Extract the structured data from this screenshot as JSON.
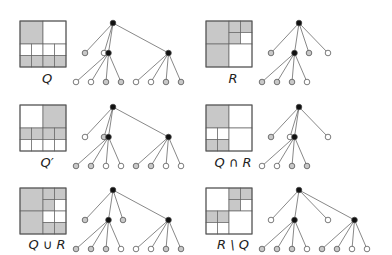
{
  "colors": {
    "gray": "#c8c8c8",
    "white": "#ffffff",
    "black": "#111111",
    "line": "#555555"
  },
  "panels": [
    {
      "id": "Q",
      "label": "Q",
      "x": 20,
      "y": 21,
      "grid": {
        "TL": "gray",
        "TR": "white",
        "BL": [
          "white",
          "white",
          "gray",
          "gray"
        ],
        "BR": [
          "white",
          "white",
          "gray",
          "gray"
        ]
      },
      "tree": {
        "root": [
          "gray",
          "white",
          {
            "children": [
              "white",
              "white",
              "gray",
              "gray"
            ]
          },
          {
            "children": [
              "white",
              "white",
              "gray",
              "gray"
            ]
          }
        ]
      }
    },
    {
      "id": "R",
      "label": "R",
      "x": 206,
      "y": 21,
      "grid": {
        "TL": "gray",
        "TR": [
          "gray",
          "gray",
          "gray",
          "white"
        ],
        "BL": "gray",
        "BR": "white"
      },
      "tree": {
        "root": [
          "gray",
          {
            "children": [
              "gray",
              "gray",
              "gray",
              "white"
            ]
          },
          "gray",
          "white"
        ]
      }
    },
    {
      "id": "Qprime",
      "label": "Q′",
      "x": 20,
      "y": 105,
      "grid": {
        "TL": "white",
        "TR": "gray",
        "BL": [
          "gray",
          "gray",
          "white",
          "white"
        ],
        "BR": [
          "gray",
          "gray",
          "white",
          "white"
        ]
      },
      "tree": {
        "root": [
          "white",
          "gray",
          {
            "children": [
              "gray",
              "gray",
              "white",
              "white"
            ]
          },
          {
            "children": [
              "gray",
              "gray",
              "white",
              "white"
            ]
          }
        ]
      }
    },
    {
      "id": "QcapR",
      "label": "Q ∩ R",
      "x": 206,
      "y": 105,
      "grid": {
        "TL": "gray",
        "TR": "white",
        "BL": [
          "white",
          "white",
          "gray",
          "gray"
        ],
        "BR": "white"
      },
      "tree": {
        "root": [
          "gray",
          "white",
          {
            "children": [
              "white",
              "white",
              "gray",
              "gray"
            ]
          },
          "white"
        ]
      }
    },
    {
      "id": "QcupR",
      "label": "Q ∪ R",
      "x": 20,
      "y": 188,
      "grid": {
        "TL": "gray",
        "TR": [
          "gray",
          "gray",
          "gray",
          "white"
        ],
        "BL": "gray",
        "BR": [
          "white",
          "white",
          "gray",
          "gray"
        ]
      },
      "tree": {
        "root": [
          "gray",
          {
            "children": [
              "gray",
              "gray",
              "gray",
              "white"
            ]
          },
          "gray",
          {
            "children": [
              "white",
              "white",
              "gray",
              "gray"
            ]
          }
        ]
      }
    },
    {
      "id": "RminusQ",
      "label": "R \\ Q",
      "x": 206,
      "y": 188,
      "grid": {
        "TL": "white",
        "TR": [
          "gray",
          "gray",
          "gray",
          "white"
        ],
        "BL": [
          "gray",
          "gray",
          "white",
          "white"
        ],
        "BR": "white"
      },
      "tree": {
        "root": [
          "white",
          {
            "children": [
              "gray",
              "gray",
              "gray",
              "white"
            ]
          },
          {
            "children": [
              "gray",
              "gray",
              "white",
              "white"
            ]
          },
          "white"
        ]
      }
    }
  ]
}
